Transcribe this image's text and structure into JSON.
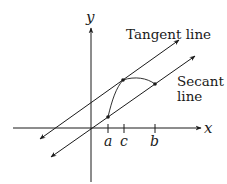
{
  "diagram": {
    "axes": {
      "x_label": "x",
      "y_label": "y"
    },
    "ticks": [
      {
        "label": "a"
      },
      {
        "label": "c"
      },
      {
        "label": "b"
      }
    ],
    "lines": {
      "tangent_label": "Tangent line",
      "secant_label_line1": "Secant",
      "secant_label_line2": "line"
    },
    "points": [
      "(a, f(a))",
      "(c, f(c))",
      "(b, f(b))"
    ],
    "colors": {
      "ink": "#1a1a1a",
      "background": "#ffffff"
    }
  }
}
